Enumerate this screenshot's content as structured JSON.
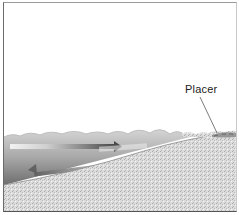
{
  "diagram": {
    "title": "",
    "labels": {
      "placer": "Placer"
    },
    "elements": [
      {
        "name": "sea-water",
        "description": "wavy water surface over sloping seabed"
      },
      {
        "name": "onshore-current-arrow",
        "direction": "right",
        "color": "#5a5a5a"
      },
      {
        "name": "backwash-arrow",
        "direction": "left",
        "color": "#6a6a6a"
      },
      {
        "name": "sand-beach",
        "description": "stippled sand sloping up to the right"
      },
      {
        "name": "placer-deposit",
        "description": "dark lens at top of beach near the waterline"
      }
    ],
    "colors": {
      "water_light": "#c9c9c9",
      "water_dark": "#7a7a7a",
      "sand": "#d9d9d9",
      "frame": "#555555"
    }
  }
}
